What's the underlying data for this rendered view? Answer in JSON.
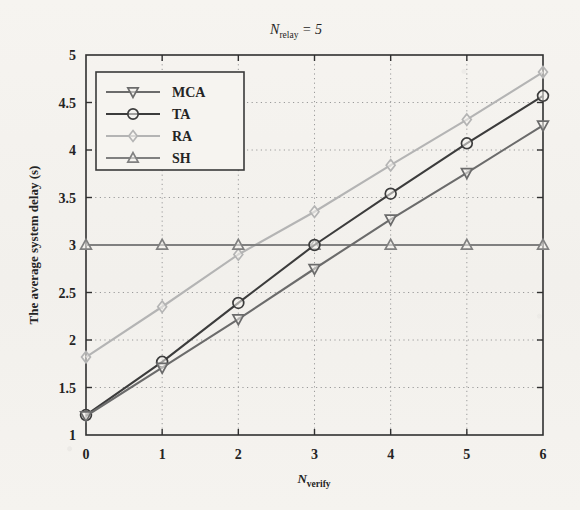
{
  "chart_data": {
    "type": "line",
    "title_parts": {
      "base": "N",
      "sub": "relay",
      "rest": " = 5"
    },
    "xlabel_parts": {
      "base": "N",
      "sub": "verify"
    },
    "xlabel": "N_verify",
    "ylabel": "The average system delay (s)",
    "x": [
      0,
      1,
      2,
      3,
      4,
      5,
      6
    ],
    "xlim": [
      0,
      6
    ],
    "ylim": [
      1,
      5
    ],
    "xticks": [
      "0",
      "1",
      "2",
      "3",
      "4",
      "5",
      "6"
    ],
    "yticks": [
      "1",
      "1.5",
      "2",
      "2.5",
      "3",
      "3.5",
      "4",
      "4.5",
      "5"
    ],
    "grid": "dotted",
    "legend_position": "upper-left-inside",
    "series": [
      {
        "name": "MCA",
        "marker": "triangle-down",
        "color": "#6b6b6b",
        "values": [
          1.2,
          1.71,
          2.22,
          2.75,
          3.27,
          3.76,
          4.26
        ]
      },
      {
        "name": "TA",
        "marker": "circle",
        "color": "#3c3c3c",
        "values": [
          1.21,
          1.77,
          2.39,
          3.0,
          3.54,
          4.07,
          4.57
        ]
      },
      {
        "name": "RA",
        "marker": "diamond",
        "color": "#b4b4b4",
        "values": [
          1.82,
          2.35,
          2.9,
          3.35,
          3.84,
          4.32,
          4.82
        ]
      },
      {
        "name": "SH",
        "marker": "triangle-up",
        "color": "#808080",
        "values": [
          3.0,
          3.0,
          3.0,
          3.0,
          3.0,
          3.0,
          3.0
        ]
      }
    ]
  },
  "legend": {
    "entries": [
      {
        "label": "MCA"
      },
      {
        "label": "TA"
      },
      {
        "label": "RA"
      },
      {
        "label": "SH"
      }
    ]
  },
  "colors": {
    "background": "#f4f2ee",
    "axis": "#303030",
    "grid": "#9a9a9a"
  }
}
